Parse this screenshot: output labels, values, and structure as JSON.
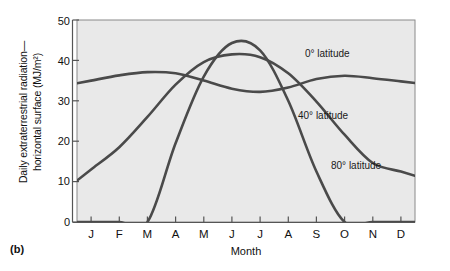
{
  "figure": {
    "panel_label": "(b)"
  },
  "axes": {
    "ylabel_line1": "Daily extraterrestrial radiation—",
    "ylabel_line2": "horizontal surface (MJ/m²)",
    "xlabel": "Month",
    "yticks": [
      "0",
      "10",
      "20",
      "30",
      "40",
      "50"
    ],
    "xticks": [
      "J",
      "F",
      "M",
      "A",
      "M",
      "J",
      "J",
      "A",
      "S",
      "O",
      "N",
      "D"
    ]
  },
  "annotations": {
    "lat0": "0° latitude",
    "lat40": "40° latitude",
    "lat80": "80° latitude"
  },
  "colors": {
    "plot_background": "#e9e9e9",
    "plot_border": "#8a8a8a",
    "curve": "#4a4a4a",
    "axis": "#555555",
    "text": "#111111",
    "page_background": "#ffffff"
  },
  "chart_data": {
    "type": "line",
    "title": "",
    "xlabel": "Month",
    "ylabel": "Daily extraterrestrial radiation— horizontal surface (MJ/m²)",
    "categories": [
      "J",
      "F",
      "M",
      "A",
      "M",
      "J",
      "J",
      "A",
      "S",
      "O",
      "N",
      "D"
    ],
    "ylim": [
      0,
      50
    ],
    "ytick_step": 10,
    "grid": false,
    "legend_position": "inline-labels",
    "series": [
      {
        "name": "0° latitude",
        "values": [
          35.0,
          36.3,
          37.1,
          36.8,
          35.0,
          33.0,
          32.2,
          33.3,
          35.4,
          36.2,
          35.6,
          34.8
        ]
      },
      {
        "name": "40° latitude",
        "values": [
          13.0,
          18.5,
          26.0,
          34.0,
          39.6,
          41.5,
          40.8,
          36.8,
          29.8,
          21.6,
          14.6,
          12.5
        ]
      },
      {
        "name": "80° latitude",
        "values": [
          0.0,
          0.0,
          0.0,
          19.5,
          36.0,
          44.3,
          42.5,
          30.0,
          12.5,
          0.0,
          0.0,
          0.0
        ]
      }
    ]
  }
}
